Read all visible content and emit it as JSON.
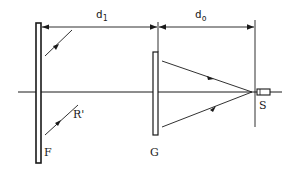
{
  "diagram": {
    "type": "optical-setup",
    "labels": {
      "d1": "d",
      "d1_sub": "1",
      "d0": "d",
      "d0_sub": "o",
      "plate_f": "F",
      "plate_g": "G",
      "source": "S",
      "reflected_ray": "R'"
    },
    "colors": {
      "stroke": "#1a1a1a",
      "background": "#ffffff"
    }
  }
}
